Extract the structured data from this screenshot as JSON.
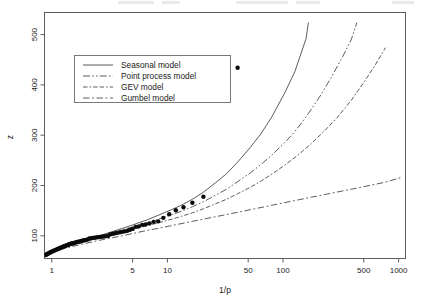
{
  "chart_data": {
    "type": "line",
    "title": "",
    "xlabel": "1/p",
    "ylabel": "z",
    "xscale": "log",
    "yscale": "linear",
    "xlim": [
      1,
      1500
    ],
    "ylim": [
      30,
      520
    ],
    "xticks": [
      1,
      5,
      10,
      50,
      100,
      500,
      1000
    ],
    "xtick_labels": [
      "1",
      "5",
      "10",
      "50",
      "100",
      "500",
      "1000"
    ],
    "yticks": [
      100,
      200,
      300,
      400,
      500
    ],
    "ytick_labels": [
      "100",
      "200",
      "300",
      "400",
      "500"
    ],
    "grid": false,
    "legend_position": "upper left",
    "series": [
      {
        "name": "Seasonal model",
        "style": "solid",
        "x": [
          1.05,
          1.2,
          1.5,
          2,
          2.5,
          3,
          4,
          5,
          6,
          8,
          10,
          13,
          16,
          20,
          25,
          32,
          40,
          50,
          65,
          80,
          100,
          130,
          160,
          200,
          210
        ],
        "y": [
          38,
          44,
          52,
          62,
          69,
          75,
          84,
          91,
          97,
          107,
          116,
          127,
          136,
          148,
          162,
          181,
          199,
          222,
          252,
          278,
          312,
          360,
          403,
          468,
          500
        ]
      },
      {
        "name": "Point process model",
        "style": "dashdotdot",
        "x": [
          1.05,
          1.2,
          1.5,
          2,
          2.5,
          3,
          4,
          5,
          6,
          8,
          10,
          13,
          16,
          20,
          25,
          32,
          40,
          50,
          65,
          80,
          100,
          130,
          160,
          200,
          260,
          330,
          420,
          500,
          560
        ],
        "y": [
          38,
          44,
          52,
          62,
          69,
          74,
          82,
          88,
          93,
          101,
          108,
          117,
          124,
          133,
          143,
          156,
          168,
          183,
          201,
          217,
          236,
          261,
          283,
          312,
          350,
          389,
          432,
          466,
          500
        ]
      },
      {
        "name": "GEV model",
        "style": "dashdot",
        "x": [
          1.05,
          1.2,
          1.5,
          2,
          2.5,
          3,
          4,
          5,
          6,
          8,
          10,
          13,
          16,
          20,
          25,
          32,
          40,
          50,
          65,
          80,
          100,
          130,
          170,
          220,
          290,
          380,
          500,
          650,
          800,
          1000
        ],
        "y": [
          38,
          44,
          51,
          60,
          66,
          71,
          78,
          83,
          88,
          95,
          101,
          108,
          114,
          121,
          129,
          139,
          148,
          159,
          172,
          184,
          198,
          216,
          236,
          258,
          284,
          312,
          345,
          382,
          413,
          450
        ]
      },
      {
        "name": "Gumbel model",
        "style": "dashed",
        "x": [
          1.05,
          1.2,
          1.5,
          2,
          3,
          5,
          8,
          10,
          20,
          50,
          100,
          200,
          500,
          1000,
          1400
        ],
        "y": [
          38,
          44,
          50,
          57,
          66,
          76,
          86,
          90,
          104,
          122,
          136,
          150,
          168,
          182,
          192
        ]
      }
    ],
    "scatter": {
      "name": "Observed annual maxima",
      "marker": "filled-circle",
      "x": [
        1.02,
        1.04,
        1.06,
        1.08,
        1.1,
        1.12,
        1.14,
        1.17,
        1.19,
        1.22,
        1.25,
        1.28,
        1.31,
        1.34,
        1.37,
        1.4,
        1.44,
        1.47,
        1.51,
        1.55,
        1.59,
        1.63,
        1.68,
        1.72,
        1.77,
        1.82,
        1.87,
        1.93,
        1.99,
        2.05,
        2.11,
        2.18,
        2.25,
        2.32,
        2.4,
        2.48,
        2.57,
        2.66,
        2.76,
        2.86,
        2.97,
        3.08,
        3.2,
        3.33,
        3.47,
        3.62,
        3.78,
        3.95,
        4.13,
        4.33,
        4.55,
        4.78,
        5.04,
        5.32,
        5.62,
        5.96,
        6.34,
        6.76,
        7.24,
        7.78,
        8.4,
        9.12,
        10.0,
        11.1,
        12.5,
        14.3,
        16.7,
        20.0,
        25.0,
        50.0
      ],
      "y": [
        37,
        38,
        39,
        40,
        41,
        42,
        43,
        44,
        45,
        46,
        47,
        48,
        49,
        50,
        51,
        52,
        53,
        54,
        55,
        56,
        57,
        58,
        59,
        60,
        60.5,
        61,
        62,
        63,
        63.5,
        64,
        65,
        66,
        66.5,
        67,
        68,
        70,
        70.5,
        71,
        71.5,
        72,
        72.5,
        73,
        73.5,
        74,
        74.5,
        75,
        78,
        79,
        80,
        81,
        82,
        83,
        84,
        85,
        87,
        89,
        93,
        94,
        97,
        98,
        100,
        103,
        104,
        111,
        118,
        126,
        132,
        141,
        153,
        410
      ]
    }
  },
  "axes": {
    "y_title": "z",
    "x_title": "1/p"
  },
  "legend": {
    "entries": [
      {
        "label": "Seasonal model",
        "style": "solid"
      },
      {
        "label": "Point process model",
        "style": "dashdotdot"
      },
      {
        "label": "GEV model",
        "style": "dashdot"
      },
      {
        "label": "Gumbel model",
        "style": "dashed"
      }
    ]
  },
  "colors": {
    "line": "#4a4a4a",
    "point": "#0b0b0b",
    "frame": "#5d5d5d",
    "text": "#1b1b1b",
    "background": "#ffffff"
  }
}
